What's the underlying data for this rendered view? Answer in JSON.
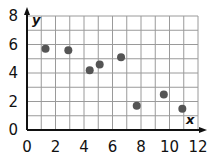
{
  "chart_data": {
    "type": "scatter",
    "title": "",
    "xlabel": "x",
    "ylabel": "y",
    "xlim": [
      0,
      12
    ],
    "ylim": [
      0,
      8
    ],
    "x_ticks": [
      0,
      2,
      4,
      6,
      8,
      10,
      12
    ],
    "y_ticks": [
      0,
      2,
      4,
      6,
      8
    ],
    "grid": true,
    "grid_step": 1,
    "legend": null,
    "series": [
      {
        "name": "points",
        "color": "#555555",
        "points": [
          {
            "x": 1.3,
            "y": 5.7
          },
          {
            "x": 2.9,
            "y": 5.6
          },
          {
            "x": 4.4,
            "y": 4.2
          },
          {
            "x": 5.1,
            "y": 4.6
          },
          {
            "x": 6.6,
            "y": 5.1
          },
          {
            "x": 7.7,
            "y": 1.7
          },
          {
            "x": 9.6,
            "y": 2.5
          },
          {
            "x": 10.9,
            "y": 1.5
          }
        ]
      }
    ]
  },
  "colors": {
    "grid": "#9a9a9a",
    "axis": "#111111",
    "point": "#555555"
  }
}
